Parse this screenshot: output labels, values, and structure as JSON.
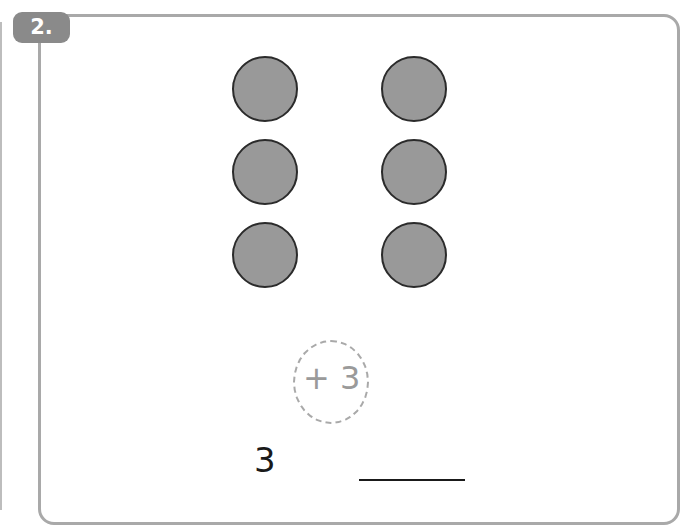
{
  "problem": {
    "number_label": "2.",
    "dots": {
      "columns": 2,
      "rows": 3,
      "count": 6,
      "fill_color": "#999999",
      "stroke_color": "#2b2b2b"
    },
    "hint_operation": "+ 3",
    "start_value": "3",
    "answer_value": ""
  },
  "colors": {
    "frame_border": "#a9a9a9",
    "badge_bg": "#8a8a8a",
    "hint_text": "#9a9a9a"
  }
}
